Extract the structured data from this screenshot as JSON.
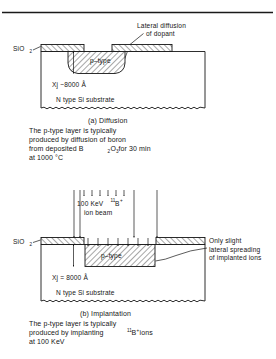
{
  "figure": {
    "top_rule": true,
    "panels": [
      {
        "id": "a",
        "callout": {
          "line1": "Lateral diffusion",
          "line2": "of dopant"
        },
        "oxide_label": "SiO",
        "oxide_label_sub": "2",
        "region_label": "p–type",
        "junction_label": "Xj ~8000 Å",
        "junction_symbol": "Xj",
        "junction_value": "~8000 Å",
        "substrate_label": "N type Si substrate",
        "caption_title": "(a) Diffusion",
        "caption_lines": [
          "The p-type layer is typically",
          "produced by diffusion of boron",
          "from deposited B₂O₃ for 30 min",
          "at 1000 °C"
        ],
        "caption_line3_parts": {
          "pre": "from deposited B",
          "sub1": "2",
          "mid": "O",
          "sub2": "3",
          "post": " for 30 min"
        }
      },
      {
        "id": "b",
        "beam_label_line1_pre": "100 KeV ",
        "beam_label_sup": "11",
        "beam_label_elem": "B",
        "beam_label_charge": "+",
        "beam_label_line2": "ion beam",
        "callout": {
          "line1": "Only slight",
          "line2": "lateral spreading",
          "line3": "of implanted ions"
        },
        "oxide_label": "SiO",
        "oxide_label_sub": "2",
        "region_label": "p–type",
        "junction_label": "Xj = 8000 Å",
        "junction_symbol": "Xj",
        "junction_value": "= 8000 Å",
        "substrate_label": "N type Si substrate",
        "caption_title": "(b)  Implantation",
        "caption_lines": [
          "The p-type layer is typically",
          "produced by implanting ¹¹B⁺ ions",
          "at 100 KeV"
        ],
        "caption_line2_parts": {
          "pre": "produced by implanting ",
          "sup": "11",
          "elem": "B",
          "charge": "+",
          "post": " ions"
        },
        "caption_line3": "at 100 KeV"
      }
    ],
    "colors": {
      "ink": "#161616",
      "background": "#ffffff"
    }
  }
}
